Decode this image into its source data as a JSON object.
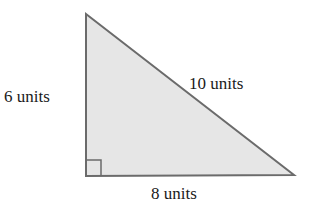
{
  "diagram": {
    "type": "right-triangle",
    "fill_color": "#e6e6e6",
    "stroke_color": "#6b6b6b",
    "labels": {
      "left_side": "6 units",
      "hypotenuse": "10 units",
      "bottom_side": "8 units"
    },
    "right_angle_marker": true
  }
}
